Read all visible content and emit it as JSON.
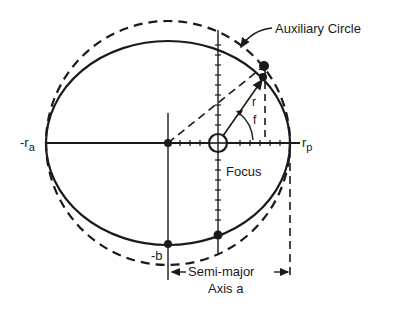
{
  "diagram": {
    "labels": {
      "auxiliary_circle": "Auxiliary Circle",
      "r_a": "-r",
      "r_a_sub": "a",
      "r_p": "r",
      "r_p_sub": "p",
      "focus": "Focus",
      "minus_b": "-b",
      "semi_major_line1": "Semi-major",
      "semi_major_line2": "Axis a",
      "radius": "r",
      "true_anomaly": "f"
    },
    "colors": {
      "ink": "#1a1a1a",
      "background": "#ffffff"
    }
  }
}
